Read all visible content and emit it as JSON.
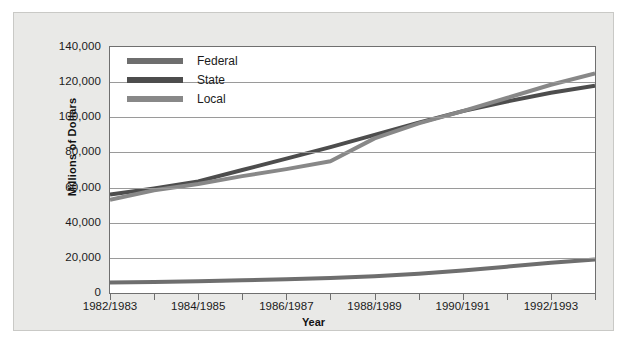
{
  "chart_data": {
    "type": "line",
    "title": "",
    "xlabel": "Year",
    "ylabel": "Millions of Dollars",
    "ylim": [
      0,
      140000
    ],
    "ytick_labels": [
      "140,000",
      "120,000",
      "100,000",
      "80,000",
      "60,000",
      "40,000",
      "20,000",
      "0"
    ],
    "ytick_values": [
      140000,
      120000,
      100000,
      80000,
      60000,
      40000,
      20000,
      0
    ],
    "grid": "horizontal",
    "legend_position": "top-left",
    "x": [
      "1982/1983",
      "1983/1984",
      "1984/1985",
      "1985/1986",
      "1986/1987",
      "1987/1988",
      "1988/1989",
      "1989/1990",
      "1990/1991",
      "1991/1992",
      "1992/1993",
      "1993/1994"
    ],
    "xtick_labels": [
      "1982/1983",
      "1984/1985",
      "1986/1987",
      "1988/1989",
      "1990/1991",
      "1992/1993"
    ],
    "xtick_label_indices": [
      0,
      2,
      4,
      6,
      8,
      10
    ],
    "series": [
      {
        "name": "Federal",
        "color": "#6e6e6e",
        "values": [
          6000,
          6300,
          6700,
          7200,
          7800,
          8600,
          9600,
          11000,
          12800,
          15000,
          17200,
          19000
        ]
      },
      {
        "name": "State",
        "color": "#4d4d4d",
        "values": [
          56000,
          59500,
          63500,
          70000,
          76500,
          83000,
          90000,
          97000,
          103500,
          109000,
          114000,
          118000
        ]
      },
      {
        "name": "Local",
        "color": "#888888",
        "values": [
          53000,
          58500,
          62000,
          66500,
          70500,
          75000,
          88000,
          96500,
          103500,
          111000,
          118500,
          125000
        ]
      }
    ]
  },
  "legend": {
    "items": [
      {
        "label": "Federal",
        "color": "#6e6e6e"
      },
      {
        "label": "State",
        "color": "#4d4d4d"
      },
      {
        "label": "Local",
        "color": "#888888"
      }
    ]
  },
  "axes": {
    "y_title": "Millions of Dollars",
    "x_title": "Year"
  }
}
